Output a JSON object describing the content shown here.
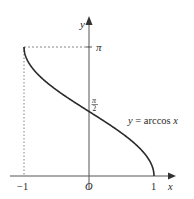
{
  "figure": {
    "type": "function-graph",
    "function_label": "y = arccos x",
    "axes": {
      "x_label": "x",
      "y_label": "y",
      "origin_label": "O",
      "x_ticks": [
        "−1",
        "1"
      ],
      "y_ticks": [
        "π/2",
        "π"
      ]
    },
    "labels": {
      "pi": "π",
      "pi_over_2_num": "π",
      "pi_over_2_den": "2",
      "x_neg1": "−1",
      "x_pos1": "1",
      "origin": "O",
      "x_axis": "x",
      "y_axis": "y",
      "curve": "y = arccos x"
    },
    "colors": {
      "curve": "#2a2a2a",
      "axis": "#555555",
      "guide": "#777777"
    },
    "key_points": [
      {
        "x": -1,
        "y": "π"
      },
      {
        "x": 0,
        "y": "π/2"
      },
      {
        "x": 1,
        "y": 0
      }
    ],
    "domain": [
      -1,
      1
    ],
    "range": [
      0,
      "π"
    ]
  }
}
